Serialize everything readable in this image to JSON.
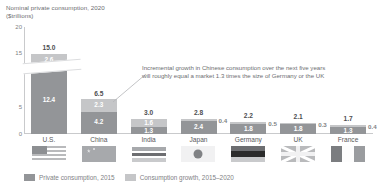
{
  "chart_data": {
    "type": "bar",
    "subtype": "stacked-bar",
    "title": "Nominal private consumption, 2020\n($trillions)",
    "xlabel": "",
    "ylabel": "",
    "ylim": [
      0,
      20
    ],
    "yticks": [
      "0",
      "5",
      "15",
      "20"
    ],
    "grid": false,
    "legend_position": "bottom-left",
    "categories": [
      "U.S.",
      "China",
      "India",
      "Japan",
      "Germany",
      "UK",
      "France"
    ],
    "series": [
      {
        "name": "Private consumption, 2015",
        "color": "#939598",
        "values": [
          12.4,
          4.2,
          1.3,
          2.4,
          1.8,
          1.8,
          1.3
        ]
      },
      {
        "name": "Consumption growth, 2015–2020",
        "color": "#c5c6c8",
        "values": [
          2.6,
          2.3,
          1.6,
          0.4,
          0.5,
          0.3,
          0.4
        ]
      }
    ],
    "totals": [
      15.0,
      6.5,
      3.0,
      2.8,
      2.2,
      2.1,
      1.7
    ],
    "total_labels": [
      "15.0",
      "6.5",
      "3.0",
      "2.8",
      "2.2",
      "2.1",
      "1.7"
    ],
    "base_labels": [
      "12.4",
      "4.2",
      "1.3",
      "2.4",
      "1.8",
      "1.8",
      "1.3"
    ],
    "growth_labels": [
      "2.6",
      "2.3",
      "1.6",
      "0.4",
      "0.5",
      "0.3",
      "0.4"
    ],
    "growth_label_outside": [
      false,
      false,
      false,
      true,
      true,
      true,
      true
    ],
    "annotations": [
      "Incremental growth in Chinese consumption over the next five years\nwill roughly equal a market 1.3 times the size of Germany or the UK"
    ],
    "axis_break": true
  },
  "chart": {
    "title": "Nominal private consumption, 2020\n($trillions)",
    "annotation": "Incremental growth in Chinese consumption over the next five years\nwill roughly equal a market 1.3 times the size of Germany or the UK",
    "yticks": [
      {
        "label": "20",
        "value": 20
      },
      {
        "label": "15",
        "value": 15
      },
      {
        "label": "5",
        "value": 5
      },
      {
        "label": "0",
        "value": 0
      }
    ],
    "bars": [
      {
        "country": "U.S.",
        "flag": "flag-us-icon",
        "total": "15.0",
        "growth": "2.6",
        "base": "12.4",
        "outside": false
      },
      {
        "country": "China",
        "flag": "flag-cn-icon",
        "total": "6.5",
        "growth": "2.3",
        "base": "4.2",
        "outside": false
      },
      {
        "country": "India",
        "flag": "flag-in-icon",
        "total": "3.0",
        "growth": "1.6",
        "base": "1.3",
        "outside": false
      },
      {
        "country": "Japan",
        "flag": "flag-jp-icon",
        "total": "2.8",
        "growth": "0.4",
        "base": "2.4",
        "outside": true
      },
      {
        "country": "Germany",
        "flag": "flag-de-icon",
        "total": "2.2",
        "growth": "0.5",
        "base": "1.8",
        "outside": true
      },
      {
        "country": "UK",
        "flag": "flag-uk-icon",
        "total": "2.1",
        "growth": "0.3",
        "base": "1.8",
        "outside": true
      },
      {
        "country": "France",
        "flag": "flag-fr-icon",
        "total": "1.7",
        "growth": "0.4",
        "base": "1.3",
        "outside": true
      }
    ],
    "legend": [
      {
        "label": "Private consumption, 2015",
        "color": "#939598"
      },
      {
        "label": "Consumption growth, 2015–2020",
        "color": "#c5c6c8"
      }
    ],
    "colors": {
      "base": "#939598",
      "growth": "#c5c6c8",
      "axis": "#c9cacc",
      "text": "#58595b"
    }
  }
}
